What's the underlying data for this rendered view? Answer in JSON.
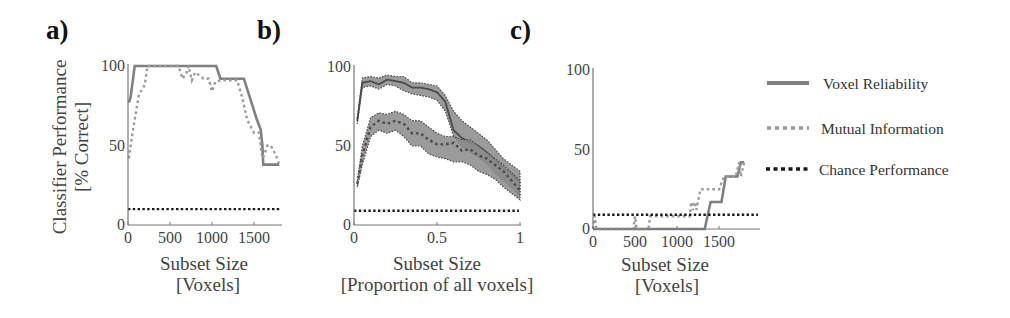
{
  "figure": {
    "legend": {
      "position": "right",
      "entries": [
        {
          "label": "Voxel Reliability",
          "style": "solid",
          "color": "#808080"
        },
        {
          "label": "Mutual Information",
          "style": "dotted",
          "color": "#9a9a9a"
        },
        {
          "label": "Chance Performance",
          "style": "dotted",
          "color": "#1a1a1a"
        }
      ]
    },
    "colors": {
      "voxel_reliability": "#808080",
      "mutual_information": "#9a9a9a",
      "chance": "#1a1a1a",
      "band_fill": "#8a8a8a",
      "band_edge": "#4a4a4a",
      "axis": "#777777"
    }
  },
  "chart_data": [
    {
      "panel": "a)",
      "type": "line",
      "title": "",
      "xlabel": "Subset Size",
      "xlabel2": "[Voxels]",
      "ylabel": "Classifier Performance",
      "ylabel2": "[% Correct]",
      "xlim": [
        0,
        1900
      ],
      "ylim": [
        0,
        100
      ],
      "xticks": [
        0,
        500,
        1000,
        1500
      ],
      "xtick_labels": [
        "0",
        "500",
        "1000",
        "1500"
      ],
      "yticks": [
        0,
        50,
        100
      ],
      "ytick_labels": [
        "0",
        "50",
        "100"
      ],
      "grid": false,
      "series": [
        {
          "name": "Voxel Reliability",
          "style": "solid",
          "x": [
            10,
            30,
            80,
            1050,
            1100,
            1380,
            1530,
            1580,
            1600,
            1610,
            1800
          ],
          "y": [
            77,
            80,
            100,
            100,
            92,
            92,
            67,
            60,
            50,
            38,
            38
          ]
        },
        {
          "name": "Mutual Information",
          "style": "dotted",
          "x": [
            10,
            60,
            130,
            200,
            230,
            600,
            650,
            700,
            720,
            760,
            800,
            900,
            960,
            1000,
            1040,
            1100,
            1300,
            1360,
            1420,
            1500,
            1560,
            1600,
            1620,
            1660,
            1700,
            1760,
            1800
          ],
          "y": [
            42,
            60,
            82,
            88,
            100,
            100,
            92,
            96,
            100,
            91,
            96,
            92,
            92,
            84,
            90,
            91,
            91,
            80,
            66,
            58,
            58,
            42,
            44,
            50,
            50,
            44,
            38
          ]
        },
        {
          "name": "Chance Performance",
          "style": "dotted",
          "x": [
            0,
            1900
          ],
          "y": [
            10,
            10
          ]
        }
      ]
    },
    {
      "panel": "b)",
      "type": "area",
      "title": "",
      "xlabel": "Subset Size",
      "xlabel2": "[Proportion of all voxels]",
      "ylabel": "",
      "xlim": [
        0,
        1
      ],
      "ylim": [
        0,
        100
      ],
      "xticks": [
        0,
        0.5,
        1
      ],
      "xtick_labels": [
        "0",
        "0.5",
        "1"
      ],
      "yticks": [
        0,
        50,
        100
      ],
      "ytick_labels": [
        "0",
        "50",
        "100"
      ],
      "grid": false,
      "series": [
        {
          "name": "Voxel Reliability",
          "style": "solid",
          "shaded_band": true,
          "x": [
            0.02,
            0.05,
            0.1,
            0.15,
            0.2,
            0.25,
            0.3,
            0.35,
            0.4,
            0.45,
            0.5,
            0.55,
            0.6,
            0.65,
            0.7,
            0.75,
            0.8,
            0.85,
            0.9,
            0.95,
            1.0
          ],
          "y": [
            66,
            90,
            91,
            89,
            92,
            91,
            90,
            87,
            87,
            86,
            84,
            78,
            60,
            55,
            52,
            50,
            46,
            41,
            36,
            32,
            27
          ],
          "upper": [
            68,
            93,
            94,
            93,
            95,
            94,
            94,
            90,
            90,
            89,
            88,
            82,
            72,
            66,
            62,
            58,
            54,
            48,
            42,
            38,
            34
          ],
          "lower": [
            64,
            87,
            88,
            86,
            89,
            88,
            85,
            83,
            82,
            81,
            79,
            72,
            56,
            50,
            46,
            43,
            39,
            33,
            28,
            24,
            18
          ]
        },
        {
          "name": "Mutual Information",
          "style": "dotted",
          "shaded_band": true,
          "x": [
            0.02,
            0.05,
            0.1,
            0.15,
            0.2,
            0.25,
            0.3,
            0.35,
            0.4,
            0.45,
            0.5,
            0.55,
            0.6,
            0.65,
            0.7,
            0.75,
            0.8,
            0.85,
            0.9,
            0.95,
            1.0
          ],
          "y": [
            26,
            44,
            62,
            66,
            64,
            66,
            64,
            58,
            58,
            54,
            51,
            51,
            52,
            47,
            48,
            44,
            42,
            38,
            34,
            28,
            22
          ],
          "upper": [
            28,
            50,
            68,
            71,
            70,
            72,
            70,
            66,
            66,
            62,
            58,
            56,
            56,
            54,
            54,
            50,
            46,
            42,
            38,
            33,
            28
          ],
          "lower": [
            24,
            38,
            56,
            60,
            58,
            60,
            56,
            50,
            50,
            45,
            43,
            42,
            40,
            40,
            38,
            34,
            32,
            29,
            24,
            20,
            16
          ]
        },
        {
          "name": "Chance Performance",
          "style": "dotted",
          "x": [
            0,
            1
          ],
          "y": [
            9,
            9
          ]
        }
      ]
    },
    {
      "panel": "c)",
      "type": "line",
      "title": "",
      "xlabel": "Subset Size",
      "xlabel2": "[Voxels]",
      "ylabel": "",
      "xlim": [
        0,
        1900
      ],
      "ylim": [
        0,
        100
      ],
      "xticks": [
        0,
        500,
        1000,
        1500
      ],
      "xtick_labels": [
        "0",
        "500",
        "1000",
        "1500"
      ],
      "yticks": [
        0,
        50,
        100
      ],
      "ytick_labels": [
        "0",
        "50",
        "100"
      ],
      "grid": false,
      "series": [
        {
          "name": "Voxel Reliability",
          "style": "solid",
          "x": [
            0,
            1330,
            1400,
            1530,
            1580,
            1720,
            1760,
            1800
          ],
          "y": [
            0,
            0,
            17,
            17,
            33,
            33,
            42,
            42
          ]
        },
        {
          "name": "Mutual Information",
          "style": "dotted",
          "x": [
            0,
            20,
            40,
            480,
            500,
            520,
            660,
            680,
            700,
            1150,
            1170,
            1190,
            1210,
            1230,
            1280,
            1300,
            1500,
            1560,
            1700,
            1740,
            1760,
            1800
          ],
          "y": [
            0,
            8,
            0,
            0,
            8,
            0,
            0,
            8,
            8,
            8,
            17,
            12,
            17,
            12,
            25,
            25,
            25,
            33,
            33,
            42,
            33,
            42
          ]
        },
        {
          "name": "Chance Performance",
          "style": "dotted",
          "x": [
            0,
            1900
          ],
          "y": [
            9,
            9
          ]
        }
      ]
    }
  ]
}
